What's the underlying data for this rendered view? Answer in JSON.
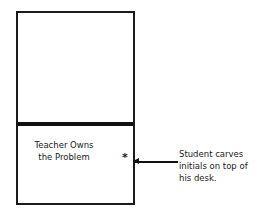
{
  "diagram": {
    "box": {
      "upper_region_text": "",
      "lower_region_text": [
        "Teacher Owns",
        "the Problem"
      ],
      "marker": "*"
    },
    "annotation": {
      "lines": [
        "Student carves",
        "initials on top of",
        "his desk."
      ]
    },
    "caption": ""
  }
}
